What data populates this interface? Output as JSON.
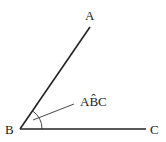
{
  "diagram": {
    "points": {
      "A": {
        "label": "A",
        "x": 90,
        "y": 27
      },
      "B": {
        "label": "B",
        "x": 20,
        "y": 129
      },
      "C": {
        "label": "C",
        "x": 145,
        "y": 129
      }
    },
    "angle_label": "AB̂C",
    "colors": {
      "line": "#222222",
      "background": "#ffffff"
    }
  }
}
